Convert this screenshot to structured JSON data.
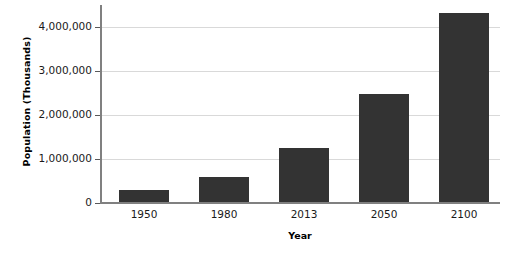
{
  "chart_data": {
    "type": "bar",
    "title": "",
    "xlabel": "Year",
    "ylabel": "Population (Thousands)",
    "categories": [
      "1950",
      "1980",
      "2013",
      "2050",
      "2100"
    ],
    "values": [
      280000,
      560000,
      1230000,
      2450000,
      4290000
    ],
    "ylim": [
      0,
      4500000
    ],
    "yticks": [
      0,
      1000000,
      2000000,
      3000000,
      4000000
    ],
    "ytick_labels": [
      "0",
      "1,000,000",
      "2,000,000",
      "3,000,000",
      "4,000,000"
    ],
    "grid": true,
    "legend": "none",
    "bar_color": "#333333",
    "gridline_color": "#d9d9d9",
    "axis_color": "#808080",
    "background_color": "#ffffff",
    "series": [
      {
        "name": "Population (Thousands)",
        "points": [
          {
            "x": "1950",
            "y": 280000
          },
          {
            "x": "1980",
            "y": 560000
          },
          {
            "x": "2013",
            "y": 1230000
          },
          {
            "x": "2050",
            "y": 2450000
          },
          {
            "x": "2100",
            "y": 4290000
          }
        ]
      }
    ]
  }
}
